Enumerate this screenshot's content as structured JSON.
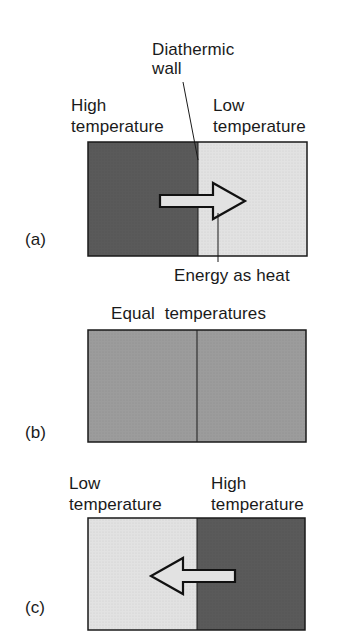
{
  "panel_a": {
    "tag": "(a)",
    "wall_label_line1": "Diathermic",
    "wall_label_line2": "wall",
    "left_label_line1": "High",
    "left_label_line2": "temperature",
    "right_label_line1": "Low",
    "right_label_line2": "temperature",
    "arrow_label": "Energy as heat",
    "arrow_direction": "right"
  },
  "panel_b": {
    "tag": "(b)",
    "title": "Equal  temperatures"
  },
  "panel_c": {
    "tag": "(c)",
    "left_label_line1": "Low",
    "left_label_line2": "temperature",
    "right_label_line1": "High",
    "right_label_line2": "temperature",
    "arrow_direction": "left"
  },
  "colors": {
    "hot": "#5a5a5a",
    "cold": "#e2e2e2",
    "equal": "#9c9c9c",
    "outline": "#1a1a1a"
  }
}
